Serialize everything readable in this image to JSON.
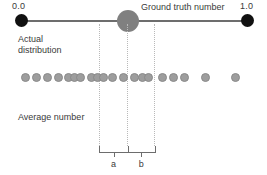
{
  "figure": {
    "type": "number-line-diagram",
    "width": 267,
    "height": 175,
    "background_color": "#ffffff"
  },
  "axis": {
    "min_label": "0.0",
    "max_label": "1.0",
    "min_value": 0.0,
    "max_value": 1.0,
    "line_color": "#6d6d6d",
    "endpoint_color": "#111111"
  },
  "ground_truth": {
    "label": "Ground truth number",
    "marker_color": "#808080",
    "position": 0.47
  },
  "annotations": {
    "actual_distribution": "Actual\ndistribution",
    "average_number": "Average number"
  },
  "segments": {
    "a_label": "a",
    "b_label": "b",
    "guide_line_color": "#b9b9b9",
    "bracket_color": "#6d6d6d",
    "left_bound": 0.345,
    "middle_bound": 0.47,
    "right_bound": 0.59
  },
  "distribution": {
    "dot_color": "#9d9d9d",
    "dot_positions": [
      0.0177,
      0.0664,
      0.115,
      0.1637,
      0.208,
      0.2345,
      0.2611,
      0.3097,
      0.3363,
      0.3628,
      0.4027,
      0.4513,
      0.5,
      0.5354,
      0.5619,
      0.6239,
      0.6726,
      0.7212,
      0.8142,
      0.9469
    ],
    "count": 20
  },
  "guide_lines": [
    0.345,
    0.47,
    0.59
  ]
}
